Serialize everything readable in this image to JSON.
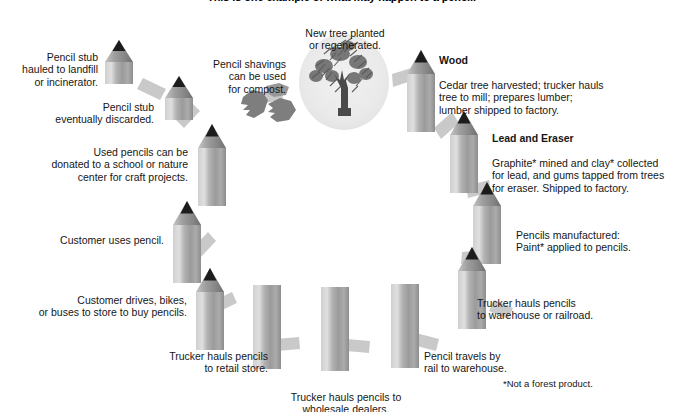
{
  "title": "This is one example of what may happen to a pencil.",
  "footnote": "*Not a forest product.",
  "colors": {
    "pencil_body_light": "#d2d2d2",
    "pencil_body_mid": "#a6a6a6",
    "pencil_body_dark": "#8f8f8f",
    "pencil_tip": "#1a1a1a",
    "arrow": "#c9c9c9",
    "circle_bg": "#ececec",
    "tree": "#5d5d5d",
    "text": "#161616"
  },
  "steps": [
    {
      "id": "new-tree",
      "heading": "",
      "body": "New tree planted\nor regenerated.",
      "icon": "tree-icon"
    },
    {
      "id": "wood",
      "heading": "Wood",
      "body": "Cedar tree harvested; trucker hauls\ntree to mill; prepares lumber;\nlumber shipped to factory.",
      "icon": "pencil-icon"
    },
    {
      "id": "lead-and-eraser",
      "heading": "Lead and Eraser",
      "body": "Graphite* mined and clay* collected\nfor lead, and gums tapped from trees\nfor eraser. Shipped to factory.",
      "icon": "pencil-icon"
    },
    {
      "id": "manufactured",
      "heading": "",
      "body": "Pencils manufactured:\nPaint* applied to pencils.",
      "icon": "pencil-icon"
    },
    {
      "id": "trucker-warehouse-railroad",
      "heading": "",
      "body": "Trucker hauls pencils\nto warehouse or railroad.",
      "icon": "pencil-icon"
    },
    {
      "id": "rail-to-warehouse",
      "heading": "",
      "body": "Pencil travels by\nrail to warehouse.",
      "icon": "pencil-icon"
    },
    {
      "id": "wholesale-dealers",
      "heading": "",
      "body": "Trucker hauls pencils to\nwholesale dealers.",
      "icon": "pencil-icon"
    },
    {
      "id": "retail-store",
      "heading": "",
      "body": "Trucker hauls pencils\nto retail store.",
      "icon": "pencil-icon"
    },
    {
      "id": "customer-drives",
      "heading": "",
      "body": "Customer drives, bikes,\nor buses to store to buy pencils.",
      "icon": "pencil-icon"
    },
    {
      "id": "customer-uses",
      "heading": "",
      "body": "Customer uses pencil.",
      "icon": "pencil-icon"
    },
    {
      "id": "donated",
      "heading": "",
      "body": "Used pencils can be\ndonated to a school or nature\ncenter for craft projects.",
      "icon": "pencil-icon"
    },
    {
      "id": "stub-discarded",
      "heading": "",
      "body": "Pencil stub\neventually discarded.",
      "icon": "pencil-stub-icon"
    },
    {
      "id": "stub-landfill",
      "heading": "",
      "body": "Pencil stub\nhauled to landfill\nor incinerator.",
      "icon": "pencil-stub-icon"
    },
    {
      "id": "shavings-compost",
      "heading": "",
      "body": "Pencil shavings\ncan be used\nfor compost.",
      "icon": "pencil-shavings-icon"
    }
  ]
}
